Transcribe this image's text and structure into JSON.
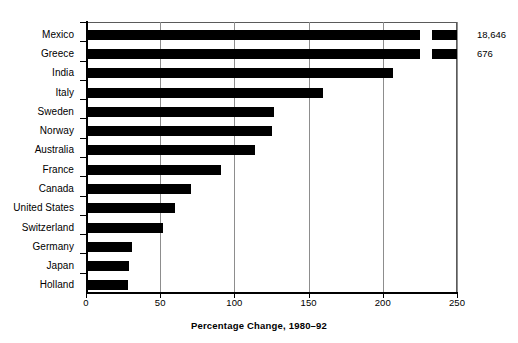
{
  "chart_data": {
    "type": "bar",
    "orientation": "horizontal",
    "title": "",
    "xlabel": "Percentage Change, 1980–92",
    "ylabel": "",
    "xlim": [
      0,
      250
    ],
    "xticks": [
      0,
      50,
      100,
      150,
      200,
      250
    ],
    "xticklabels": [
      "0",
      "50",
      "100",
      "150",
      "200",
      "250"
    ],
    "grid": "vertical",
    "legend": "none",
    "bar_color": "#000000",
    "categories": [
      "Mexico",
      "Greece",
      "India",
      "Italy",
      "Sweden",
      "Norway",
      "Australia",
      "France",
      "Canada",
      "United States",
      "Switzerland",
      "Germany",
      "Japan",
      "Holland"
    ],
    "values": [
      18646,
      676,
      207,
      160,
      127,
      125,
      114,
      91,
      71,
      60,
      52,
      31,
      29,
      28
    ],
    "plotted_values": [
      250,
      250,
      207,
      160,
      127,
      125,
      114,
      91,
      71,
      60,
      52,
      31,
      29,
      28
    ],
    "broken_axis": [
      true,
      true,
      false,
      false,
      false,
      false,
      false,
      false,
      false,
      false,
      false,
      false,
      false,
      false
    ],
    "break_at": 225,
    "break_resume": 233,
    "annotations": [
      {
        "category": "Mexico",
        "text": "18,646"
      },
      {
        "category": "Greece",
        "text": "676"
      }
    ]
  },
  "axis": {
    "title": "Percentage Change, 1980–92"
  }
}
